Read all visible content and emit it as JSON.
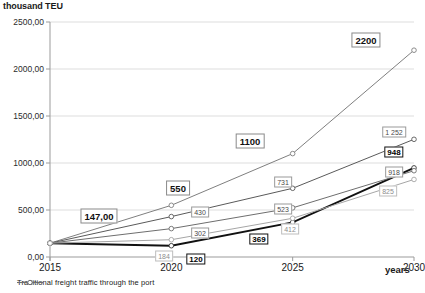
{
  "chart_data": {
    "type": "line",
    "title": "",
    "ylabel": "thousand TEU",
    "xlabel": "years",
    "x": [
      2015,
      2020,
      2025,
      2030
    ],
    "xtick_labels": [
      "2015",
      "2020",
      "2025",
      "2030"
    ],
    "ylim": [
      0,
      2500
    ],
    "ytick_labels": [
      "0,00",
      "500,00",
      "1000,00",
      "1500,00",
      "2000,00",
      "2500,00"
    ],
    "ytick_values": [
      0,
      500,
      1000,
      1500,
      2000,
      2500
    ],
    "grid": "horizontal",
    "legend_position": "bottom-left",
    "legend": [
      "Traditional freight traffic through the port"
    ],
    "origin_label": "147,00",
    "series": [
      {
        "name": "series-1-optimistic",
        "color": "#7f7f7f",
        "values": [
          147,
          550,
          1100,
          2200
        ],
        "labels": [
          "147,00",
          "550",
          "1100",
          "2200"
        ]
      },
      {
        "name": "series-2",
        "color": "#5a5a5a",
        "values": [
          147,
          430,
          731,
          1252
        ],
        "labels": [
          "147,00",
          "430",
          "731",
          "1 252"
        ]
      },
      {
        "name": "series-3-traditional",
        "color": "#111111",
        "values": [
          147,
          120,
          369,
          948
        ],
        "labels": [
          "147,00",
          "120",
          "369",
          "948"
        ]
      },
      {
        "name": "series-4",
        "color": "#6e6e6e",
        "values": [
          147,
          302,
          523,
          918
        ],
        "labels": [
          "147,00",
          "302",
          "523",
          "918"
        ]
      },
      {
        "name": "series-5",
        "color": "#a6a6a6",
        "values": [
          147,
          184,
          412,
          825
        ],
        "labels": [
          "147,00",
          "184",
          "412",
          "825"
        ]
      }
    ],
    "data_labels": [
      {
        "text": "147,00",
        "x": 99,
        "y": 216,
        "style": "big"
      },
      {
        "text": "2200",
        "x": 366,
        "y": 40,
        "style": "big"
      },
      {
        "text": "1100",
        "x": 250,
        "y": 141,
        "style": "big"
      },
      {
        "text": "550",
        "x": 178,
        "y": 188,
        "style": "big"
      },
      {
        "text": "1 252",
        "x": 394,
        "y": 132,
        "style": "plain"
      },
      {
        "text": "948",
        "x": 394,
        "y": 152,
        "style": "bold-box"
      },
      {
        "text": "918",
        "x": 394,
        "y": 172,
        "style": "plain"
      },
      {
        "text": "825",
        "x": 388,
        "y": 191,
        "style": "faint"
      },
      {
        "text": "731",
        "x": 283,
        "y": 182,
        "style": "plain"
      },
      {
        "text": "523",
        "x": 283,
        "y": 209,
        "style": "plain"
      },
      {
        "text": "412",
        "x": 290,
        "y": 229,
        "style": "faint"
      },
      {
        "text": "369",
        "x": 259,
        "y": 239,
        "style": "bold-box"
      },
      {
        "text": "430",
        "x": 200,
        "y": 212,
        "style": "plain"
      },
      {
        "text": "302",
        "x": 200,
        "y": 233,
        "style": "plain"
      },
      {
        "text": "184",
        "x": 164,
        "y": 256,
        "style": "faint"
      },
      {
        "text": "120",
        "x": 196,
        "y": 259,
        "style": "bold-box"
      }
    ]
  }
}
